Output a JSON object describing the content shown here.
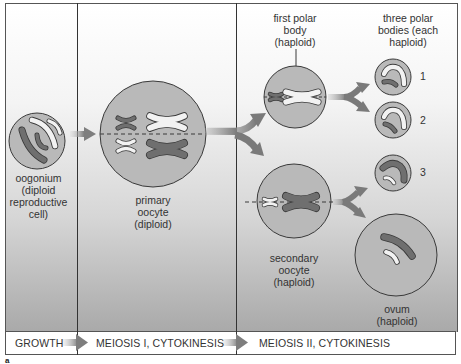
{
  "diagram": {
    "stages": [
      {
        "id": "growth",
        "label": "GROWTH"
      },
      {
        "id": "meiosis1",
        "label": "MEIOSIS I, CYTOKINESIS"
      },
      {
        "id": "meiosis2",
        "label": "MEIOSIS II, CYTOKINESIS"
      }
    ],
    "cells": {
      "oogonium": {
        "label": "oogonium (diploid reproductive cell)",
        "lines": [
          "oogonium",
          "(diploid",
          "reproductive",
          "cell)"
        ]
      },
      "primary_oocyte": {
        "label": "primary oocyte (diploid)",
        "lines": [
          "primary",
          "oocyte",
          "(diploid)"
        ]
      },
      "first_polar_body": {
        "label": "first polar body (haploid)",
        "lines": [
          "first polar",
          "body",
          "(haploid)"
        ]
      },
      "three_polar_bodies": {
        "label": "three polar bodies (each haploid)",
        "lines": [
          "three polar",
          "bodies (each",
          "haploid)"
        ],
        "numbers": [
          "1",
          "2",
          "3"
        ]
      },
      "secondary_oocyte": {
        "label": "secondary oocyte (haploid)",
        "lines": [
          "secondary",
          "oocyte",
          "(haploid)"
        ]
      },
      "ovum": {
        "label": "ovum (haploid)",
        "lines": [
          "ovum",
          "(haploid)"
        ]
      }
    },
    "figure_letter": "a"
  },
  "colors": {
    "cell_fill": "#b9b9b9",
    "cell_stroke": "#3a3a3a",
    "chromosome_dark": "#6f6f6f",
    "chromosome_light": "#f2f2f2",
    "arrow": "#8a8a8a",
    "background_top": "#ffffff",
    "background_bottom": "#a9a9a9"
  }
}
